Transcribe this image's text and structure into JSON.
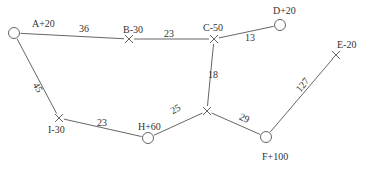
{
  "diagram": {
    "title": "",
    "nodes": [
      {
        "id": "A",
        "label": "A+20",
        "shape": "circle",
        "x": 14,
        "y": 33,
        "lx": 32,
        "ly": 27
      },
      {
        "id": "B",
        "label": "B-30",
        "shape": "cross",
        "x": 129,
        "y": 39,
        "lx": 123,
        "ly": 33
      },
      {
        "id": "C",
        "label": "C-50",
        "shape": "cross",
        "x": 214,
        "y": 39,
        "lx": 203,
        "ly": 31
      },
      {
        "id": "D",
        "label": "D+20",
        "shape": "circle",
        "x": 280,
        "y": 25,
        "lx": 273,
        "ly": 14
      },
      {
        "id": "E",
        "label": "E-20",
        "shape": "cross",
        "x": 336,
        "y": 55,
        "lx": 337,
        "ly": 48
      },
      {
        "id": "J",
        "label": "",
        "shape": "cross",
        "x": 207,
        "y": 111,
        "lx": 0,
        "ly": 0
      },
      {
        "id": "F",
        "label": "F+100",
        "shape": "circle",
        "x": 266,
        "y": 137,
        "lx": 262,
        "ly": 160
      },
      {
        "id": "H",
        "label": "H+60",
        "shape": "circle",
        "x": 148,
        "y": 138,
        "lx": 138,
        "ly": 130
      },
      {
        "id": "I",
        "label": "I-30",
        "shape": "cross",
        "x": 59,
        "y": 118,
        "lx": 48,
        "ly": 133
      }
    ],
    "edges": [
      {
        "from": "A",
        "to": "B",
        "label": "36",
        "lx": 84,
        "ly": 32,
        "rot": 0
      },
      {
        "from": "B",
        "to": "C",
        "label": "23",
        "lx": 169,
        "ly": 37,
        "rot": 0
      },
      {
        "from": "C",
        "to": "D",
        "label": "13",
        "lx": 250,
        "ly": 41,
        "rot": 0
      },
      {
        "from": "C",
        "to": "J",
        "label": "18",
        "lx": 213,
        "ly": 78,
        "rot": 0
      },
      {
        "from": "E",
        "to": "F",
        "label": "127",
        "lx": 305,
        "ly": 87,
        "rot": -50
      },
      {
        "from": "J",
        "to": "F",
        "label": "29",
        "lx": 243,
        "ly": 121,
        "rot": 25
      },
      {
        "from": "H",
        "to": "J",
        "label": "25",
        "lx": 177,
        "ly": 112,
        "rot": -30
      },
      {
        "from": "I",
        "to": "H",
        "label": "23",
        "lx": 102,
        "ly": 126,
        "rot": 0
      },
      {
        "from": "A",
        "to": "I",
        "label": "45",
        "lx": 35,
        "ly": 89,
        "rot": 60
      }
    ]
  }
}
